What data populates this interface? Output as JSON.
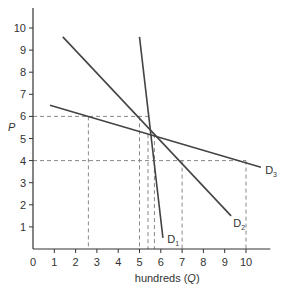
{
  "chart_data": {
    "type": "line",
    "title": "",
    "xlabel": "hundreds (Q)",
    "ylabel": "P",
    "xlim": [
      0,
      11
    ],
    "ylim": [
      0,
      10.5
    ],
    "x_ticks": [
      0,
      1,
      2,
      3,
      4,
      5,
      6,
      7,
      8,
      9,
      10
    ],
    "y_ticks": [
      1,
      2,
      3,
      4,
      5,
      6,
      7,
      8,
      9,
      10
    ],
    "grid": false,
    "series": [
      {
        "name": "D1",
        "label_main": "D",
        "label_sub": "1",
        "points": [
          [
            5.0,
            9.6
          ],
          [
            6.1,
            0.5
          ]
        ]
      },
      {
        "name": "D2",
        "label_main": "D",
        "label_sub": "2",
        "points": [
          [
            1.4,
            9.6
          ],
          [
            9.3,
            1.5
          ]
        ]
      },
      {
        "name": "D3",
        "label_main": "D",
        "label_sub": "3",
        "points": [
          [
            0.8,
            6.5
          ],
          [
            10.7,
            3.7
          ]
        ]
      }
    ],
    "reference_lines": {
      "horizontal": [
        6,
        4
      ],
      "vertical": [
        2.6,
        5.0,
        5.4,
        5.7,
        7.0,
        10.0
      ]
    },
    "colors": {
      "curves": "#444444",
      "dashed": "#888888",
      "axes": "#333333"
    }
  }
}
